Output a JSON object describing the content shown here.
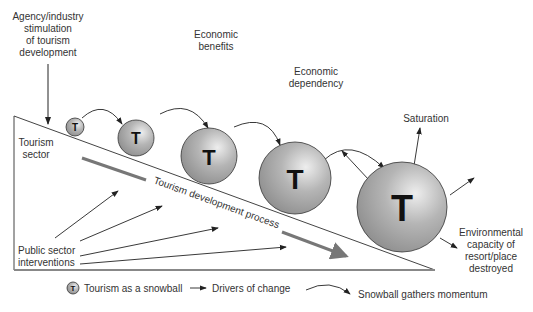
{
  "labels": {
    "agency": [
      "Agency/industry",
      "stimulation",
      "of tourism",
      "development"
    ],
    "economic_benefits": [
      "Economic",
      "benefits"
    ],
    "economic_dependency": [
      "Economic",
      "dependency"
    ],
    "saturation": "Saturation",
    "tourism_sector": [
      "Tourism",
      "sector"
    ],
    "process": "Tourism development process",
    "public_sector": [
      "Public sector",
      "interventions"
    ],
    "environmental": [
      "Environmental",
      "capacity of",
      "resort/place",
      "destroyed"
    ]
  },
  "ball_letter": "T",
  "legend": {
    "snowball": "Tourism as a snowball",
    "drivers": "Drivers of change",
    "momentum": "Snowball gathers momentum"
  },
  "colors": {
    "ball_fill": "#a8a8a8",
    "ball_highlight": "#e6e6e6",
    "line": "#333333",
    "process_arrow": "#777777"
  }
}
